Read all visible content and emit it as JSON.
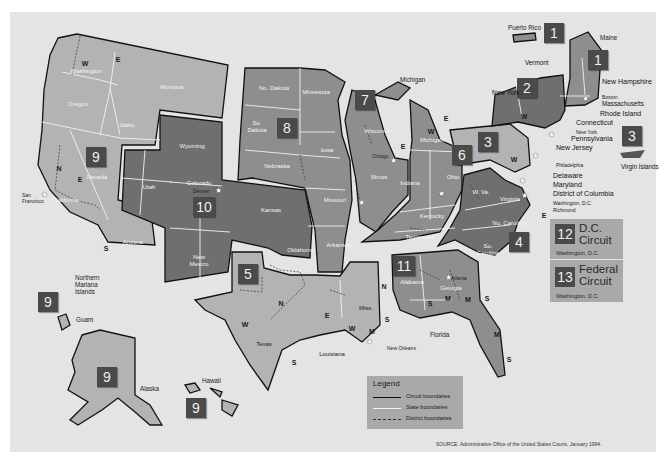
{
  "figure": {
    "source": "SOURCE: Administrative Office of the United States Courts, January 1994."
  },
  "colors": {
    "background": "#e4e4e4",
    "circuit_light": "#b3b3b3",
    "circuit_medium": "#8e8e8e",
    "circuit_dark": "#6f6f6f",
    "badge": "#4a4a4a",
    "state_boundary": "#f2f2f2",
    "circuit_boundary": "#111111"
  },
  "circuits": [
    {
      "number": "1",
      "states": [
        "Maine",
        "New Hampshire",
        "Massachusetts",
        "Rhode Island",
        "Puerto Rico"
      ]
    },
    {
      "number": "2",
      "states": [
        "New York",
        "Vermont",
        "Connecticut"
      ]
    },
    {
      "number": "3",
      "states": [
        "Pennsylvania",
        "New Jersey",
        "Delaware",
        "Virgin Islands"
      ]
    },
    {
      "number": "4",
      "states": [
        "Maryland",
        "W. Va.",
        "Virginia",
        "No. Carolina",
        "So. Carolina"
      ]
    },
    {
      "number": "5",
      "states": [
        "Texas",
        "Louisiana",
        "Miss."
      ]
    },
    {
      "number": "6",
      "states": [
        "Michigan",
        "Ohio",
        "Kentucky",
        "Tennessee"
      ]
    },
    {
      "number": "7",
      "states": [
        "Wisconsin",
        "Illinois",
        "Indiana"
      ]
    },
    {
      "number": "8",
      "states": [
        "No. Dakota",
        "So. Dakota",
        "Nebraska",
        "Minnesota",
        "Iowa",
        "Missouri",
        "Arkansas"
      ]
    },
    {
      "number": "9",
      "states": [
        "Washington",
        "Oregon",
        "California",
        "Nevada",
        "Idaho",
        "Montana",
        "Arizona",
        "Alaska",
        "Hawaii",
        "Guam",
        "Northern Mariana Islands"
      ]
    },
    {
      "number": "10",
      "states": [
        "Wyoming",
        "Utah",
        "Colorado",
        "Kansas",
        "Oklahoma",
        "New Mexico"
      ]
    },
    {
      "number": "11",
      "states": [
        "Alabama",
        "Georgia",
        "Florida"
      ]
    },
    {
      "number": "12",
      "title": "D.C. Circuit",
      "title_line1": "D.C.",
      "title_line2": "Circuit",
      "location": "Washington, D.C."
    },
    {
      "number": "13",
      "title": "Federal Circuit",
      "title_line1": "Federal",
      "title_line2": "Circuit",
      "location": "Washington, D.C."
    }
  ],
  "badges": {
    "b1_pr": "1",
    "b1_me": "1",
    "b2": "2",
    "b3": "3",
    "b3_vi": "3",
    "b4": "4",
    "b5": "5",
    "b6": "6",
    "b7": "7",
    "b8": "8",
    "b9": "9",
    "b9_guam": "9",
    "b9_ak": "9",
    "b9_hi": "9",
    "b10": "10",
    "b11": "11"
  },
  "state_labels": {
    "washington": "Washington",
    "oregon": "Oregon",
    "idaho": "Idaho",
    "montana": "Montana",
    "nevada": "Nevada",
    "california": "California",
    "arizona": "Arizona",
    "utah": "Utah",
    "wyoming": "Wyoming",
    "colorado": "Colorado",
    "new_mexico": "New Mexico",
    "kansas": "Kansas",
    "oklahoma": "Oklahoma",
    "texas": "Texas",
    "no_dakota": "No. Dakota",
    "so_dakota": "So. Dakota",
    "nebraska": "Nebraska",
    "minnesota": "Minnesota",
    "iowa": "Iowa",
    "missouri": "Missouri",
    "arkansas": "Arkansas",
    "louisiana": "Louisiana",
    "miss": "Miss.",
    "wisconsin": "Wisconsin",
    "illinois": "Illinois",
    "indiana": "Indiana",
    "michigan_upper": "Michigan",
    "michigan": "Michigan",
    "ohio": "Ohio",
    "kentucky": "Kentucky",
    "tennessee": "Tennessee",
    "alabama": "Alabama",
    "georgia": "Georgia",
    "florida": "Florida",
    "w_va": "W. Va.",
    "virginia": "Virginia",
    "no_carolina": "No. Carolina",
    "so_carolina": "So. Carolina",
    "new_york": "New York",
    "vermont": "Vermont",
    "maine": "Maine",
    "new_hampshire": "New Hampshire",
    "massachusetts": "Massachusetts",
    "rhode_island": "Rhode Island",
    "connecticut": "Connecticut",
    "pennsylvania": "Pennsylvania",
    "new_jersey": "New Jersey",
    "delaware": "Delaware",
    "maryland": "Maryland",
    "district_of_columbia": "District of Columbia",
    "puerto_rico": "Puerto Rico",
    "virgin_islands": "Virgin Islands",
    "northern_mariana": "Northern Mariana Islands",
    "guam": "Guam",
    "alaska": "Alaska",
    "hawaii": "Hawaii"
  },
  "cities": {
    "san_francisco": "San Francisco",
    "denver": "Denver",
    "chicago": "Chicago",
    "st_louis": "St. Louis",
    "cincinnati": "Cincinnati",
    "new_orleans": "New Orleans",
    "atlanta": "Atlanta",
    "richmond": "Richmond",
    "washington_dc": "Washington, D.C.",
    "philadelphia": "Philadelphia",
    "new_york": "New York",
    "boston": "Boston"
  },
  "legend": {
    "title": "Legend",
    "items": [
      {
        "label": "Circuit boundaries",
        "style": "solid-black"
      },
      {
        "label": "State boundaries",
        "style": "solid-white"
      },
      {
        "label": "District boundaries",
        "style": "dashed"
      }
    ]
  }
}
